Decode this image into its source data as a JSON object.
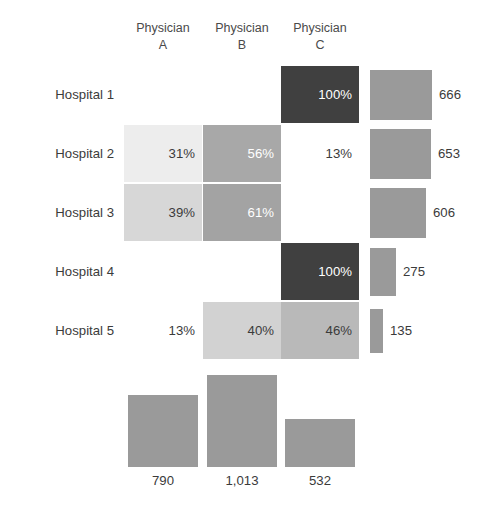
{
  "chart_data": {
    "type": "heatmap",
    "title": "",
    "subtitle": "",
    "xlabel": "",
    "ylabel": "",
    "grid": false,
    "legend": "none",
    "columns": [
      "Physician A",
      "Physician B",
      "Physician C"
    ],
    "column_header_lines": [
      [
        "Physician",
        "A"
      ],
      [
        "Physician",
        "B"
      ],
      [
        "Physician",
        "C"
      ]
    ],
    "rows": [
      "Hospital 1",
      "Hospital 2",
      "Hospital 3",
      "Hospital 4",
      "Hospital 5"
    ],
    "cells": [
      [
        {
          "label": "",
          "value": null,
          "fill": "none",
          "text": "dark"
        },
        {
          "label": "",
          "value": null,
          "fill": "none",
          "text": "dark"
        },
        {
          "label": "100%",
          "value": 100,
          "fill": "#404040",
          "text": "light"
        }
      ],
      [
        {
          "label": "31%",
          "value": 31,
          "fill": "#ededed",
          "text": "dark"
        },
        {
          "label": "56%",
          "value": 56,
          "fill": "#a8a8a8",
          "text": "light"
        },
        {
          "label": "13%",
          "value": 13,
          "fill": "none",
          "text": "dark"
        }
      ],
      [
        {
          "label": "39%",
          "value": 39,
          "fill": "#d7d7d7",
          "text": "dark"
        },
        {
          "label": "61%",
          "value": 61,
          "fill": "#a3a3a3",
          "text": "light"
        },
        {
          "label": "",
          "value": null,
          "fill": "none",
          "text": "dark"
        }
      ],
      [
        {
          "label": "",
          "value": null,
          "fill": "none",
          "text": "dark"
        },
        {
          "label": "",
          "value": null,
          "fill": "none",
          "text": "dark"
        },
        {
          "label": "100%",
          "value": 100,
          "fill": "#404040",
          "text": "light"
        }
      ],
      [
        {
          "label": "13%",
          "value": 13,
          "fill": "none",
          "text": "dark"
        },
        {
          "label": "40%",
          "value": 40,
          "fill": "#d2d2d2",
          "text": "dark"
        },
        {
          "label": "46%",
          "value": 46,
          "fill": "#b9b9b9",
          "text": "dark"
        }
      ]
    ],
    "row_totals": {
      "values": [
        666,
        653,
        606,
        275,
        135
      ],
      "labels": [
        "666",
        "653",
        "606",
        "275",
        "135"
      ],
      "max": 666,
      "bar_color": "#9a9a9a",
      "orientation": "horizontal"
    },
    "column_totals": {
      "values": [
        790,
        1013,
        532
      ],
      "labels": [
        "790",
        "1,013",
        "532"
      ],
      "max": 1013,
      "bar_color": "#9a9a9a",
      "orientation": "vertical"
    },
    "colors": {
      "background": "#ffffff",
      "text_dark": "#3b3b3b",
      "text_light": "#ffffff",
      "bar": "#9a9a9a",
      "cell_max": "#404040"
    }
  }
}
